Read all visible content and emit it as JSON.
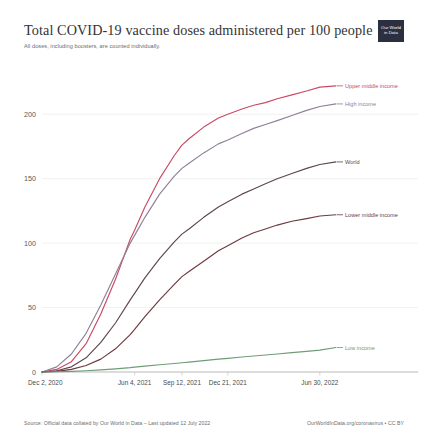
{
  "header": {
    "title": "Total COVID-19 vaccine doses administered per 100 people",
    "subtitle": "All doses, including boosters, are counted individually.",
    "logo_line1": "Our World",
    "logo_line2": "in Data"
  },
  "footer": {
    "source": "Source: Official data collated by Our World in Data – Last updated 12 July 2022",
    "license": "OurWorldInData.org/coronavirus • CC BY"
  },
  "axis": {
    "y_ticks": [
      "0",
      "50",
      "100",
      "150",
      "200"
    ],
    "x_ticks": [
      "Dec 2, 2020",
      "Jun 4, 2021",
      "Sep 12, 2021",
      "Dec 21, 2021",
      "Jun 30, 2022"
    ]
  },
  "series_labels": {
    "upper_middle_income": "Upper middle income",
    "high_income": "High income",
    "world": "World",
    "lower_middle_income": "Lower middle income",
    "low_income": "Low income"
  },
  "colors": {
    "upper_middle_income": "#c94a63",
    "high_income": "#8f8098",
    "world": "#5d4550",
    "lower_middle_income": "#6b3a3f",
    "low_income": "#6f9c77",
    "gridline": "#e8e8e8",
    "axis_text": "#57585c"
  },
  "chart_data": {
    "type": "line",
    "title": "Total COVID-19 vaccine doses administered per 100 people",
    "subtitle": "All doses, including boosters, are counted individually.",
    "xlabel": "",
    "ylabel": "",
    "ylim": [
      0,
      225
    ],
    "grid": true,
    "legend": "inline-right-labels",
    "x_tick_labels": [
      "Dec 2, 2020",
      "Jun 4, 2021",
      "Sep 12, 2021",
      "Dec 21, 2021",
      "Jun 30, 2022"
    ],
    "x_tick_positions": [
      0,
      0.315,
      0.476,
      0.632,
      0.945
    ],
    "y_tick_values": [
      0,
      50,
      100,
      150,
      200
    ],
    "x": [
      0,
      0.05,
      0.1,
      0.15,
      0.2,
      0.25,
      0.3,
      0.315,
      0.35,
      0.4,
      0.45,
      0.476,
      0.5,
      0.55,
      0.6,
      0.632,
      0.68,
      0.72,
      0.76,
      0.8,
      0.85,
      0.9,
      0.945,
      1.0
    ],
    "series": [
      {
        "name": "Upper middle income",
        "color": "#c94a63",
        "end_value": 222,
        "values": [
          0,
          2,
          8,
          22,
          45,
          72,
          103,
          110,
          128,
          150,
          168,
          176,
          181,
          190,
          197,
          200,
          204,
          207,
          209,
          212,
          215,
          218,
          221,
          222
        ]
      },
      {
        "name": "High income",
        "color": "#8f8098",
        "end_value": 208,
        "values": [
          0,
          4,
          14,
          30,
          52,
          76,
          100,
          106,
          120,
          138,
          152,
          158,
          162,
          170,
          177,
          180,
          185,
          189,
          192,
          195,
          199,
          203,
          206,
          208
        ]
      },
      {
        "name": "World",
        "color": "#5d4550",
        "end_value": 163,
        "values": [
          0,
          1,
          4,
          11,
          23,
          38,
          56,
          61,
          73,
          88,
          101,
          107,
          111,
          120,
          128,
          132,
          138,
          142,
          146,
          150,
          154,
          158,
          161,
          163
        ]
      },
      {
        "name": "Lower middle income",
        "color": "#6b3a3f",
        "end_value": 122,
        "values": [
          0,
          0.5,
          2,
          5,
          10,
          18,
          29,
          33,
          43,
          56,
          68,
          74,
          78,
          86,
          94,
          98,
          104,
          108,
          111,
          114,
          117,
          119,
          121,
          122
        ]
      },
      {
        "name": "Low income",
        "color": "#6f9c77",
        "end_value": 19,
        "values": [
          0,
          0.2,
          0.5,
          1,
          1.6,
          2.4,
          3.4,
          3.8,
          4.6,
          5.6,
          6.6,
          7.2,
          7.7,
          8.8,
          10.0,
          10.6,
          11.6,
          12.4,
          13.2,
          14.0,
          15.0,
          16.0,
          17.0,
          19
        ]
      }
    ]
  }
}
